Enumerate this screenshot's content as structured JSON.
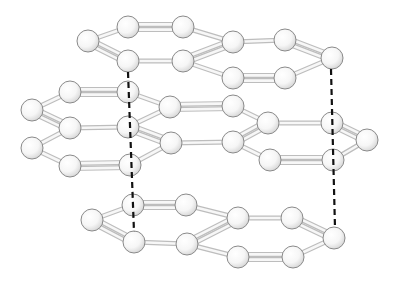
{
  "diagram": {
    "title": "",
    "type": "layered molecular ball-and-stick",
    "colors": {
      "atom_fill": "#ffffff",
      "atom_shade": "#d6d6d6",
      "atom_stroke": "#8a8a8a",
      "bond": "#bdbdbd",
      "interlayer_dash": "#111111"
    },
    "atom_radius": 11,
    "atoms": [
      {
        "id": "t1",
        "x": 88,
        "y": 41
      },
      {
        "id": "t2",
        "x": 128,
        "y": 27
      },
      {
        "id": "t3",
        "x": 183,
        "y": 27
      },
      {
        "id": "t4",
        "x": 233,
        "y": 42
      },
      {
        "id": "t5",
        "x": 183,
        "y": 61
      },
      {
        "id": "t6",
        "x": 128,
        "y": 61
      },
      {
        "id": "t7",
        "x": 285,
        "y": 40
      },
      {
        "id": "t8",
        "x": 332,
        "y": 58
      },
      {
        "id": "t9",
        "x": 285,
        "y": 78
      },
      {
        "id": "t10",
        "x": 233,
        "y": 78
      },
      {
        "id": "m1",
        "x": 70,
        "y": 92
      },
      {
        "id": "m2",
        "x": 128,
        "y": 92
      },
      {
        "id": "m3",
        "x": 32,
        "y": 110
      },
      {
        "id": "m4",
        "x": 70,
        "y": 128
      },
      {
        "id": "m5",
        "x": 128,
        "y": 127
      },
      {
        "id": "m6",
        "x": 32,
        "y": 148
      },
      {
        "id": "m7",
        "x": 70,
        "y": 166
      },
      {
        "id": "m8",
        "x": 130,
        "y": 165
      },
      {
        "id": "m9",
        "x": 170,
        "y": 107
      },
      {
        "id": "m10",
        "x": 171,
        "y": 143
      },
      {
        "id": "m11",
        "x": 233,
        "y": 106
      },
      {
        "id": "m12",
        "x": 268,
        "y": 123
      },
      {
        "id": "m13",
        "x": 233,
        "y": 142
      },
      {
        "id": "m14",
        "x": 270,
        "y": 160
      },
      {
        "id": "m15",
        "x": 332,
        "y": 123
      },
      {
        "id": "m16",
        "x": 367,
        "y": 140
      },
      {
        "id": "m17",
        "x": 333,
        "y": 160
      },
      {
        "id": "b1",
        "x": 92,
        "y": 220
      },
      {
        "id": "b2",
        "x": 133,
        "y": 205
      },
      {
        "id": "b3",
        "x": 186,
        "y": 205
      },
      {
        "id": "b4",
        "x": 238,
        "y": 218
      },
      {
        "id": "b5",
        "x": 187,
        "y": 244
      },
      {
        "id": "b6",
        "x": 134,
        "y": 242
      },
      {
        "id": "b7",
        "x": 292,
        "y": 218
      },
      {
        "id": "b8",
        "x": 334,
        "y": 238
      },
      {
        "id": "b9",
        "x": 293,
        "y": 257
      },
      {
        "id": "b10",
        "x": 238,
        "y": 257
      }
    ],
    "bonds": [
      {
        "a": "t1",
        "b": "t2",
        "order": 1
      },
      {
        "a": "t2",
        "b": "t3",
        "order": 2
      },
      {
        "a": "t3",
        "b": "t4",
        "order": 1
      },
      {
        "a": "t4",
        "b": "t5",
        "order": 2
      },
      {
        "a": "t5",
        "b": "t6",
        "order": 1
      },
      {
        "a": "t6",
        "b": "t1",
        "order": 2
      },
      {
        "a": "t4",
        "b": "t7",
        "order": 1
      },
      {
        "a": "t7",
        "b": "t8",
        "order": 2
      },
      {
        "a": "t8",
        "b": "t9",
        "order": 1
      },
      {
        "a": "t9",
        "b": "t10",
        "order": 2
      },
      {
        "a": "t10",
        "b": "t5",
        "order": 1
      },
      {
        "a": "m3",
        "b": "m1",
        "order": 1
      },
      {
        "a": "m1",
        "b": "m2",
        "order": 2
      },
      {
        "a": "m3",
        "b": "m4",
        "order": 2
      },
      {
        "a": "m4",
        "b": "m5",
        "order": 1
      },
      {
        "a": "m4",
        "b": "m6",
        "order": 1
      },
      {
        "a": "m6",
        "b": "m7",
        "order": 1
      },
      {
        "a": "m7",
        "b": "m8",
        "order": 2
      },
      {
        "a": "m2",
        "b": "m9",
        "order": 1
      },
      {
        "a": "m5",
        "b": "m9",
        "order": 1
      },
      {
        "a": "m5",
        "b": "m10",
        "order": 2
      },
      {
        "a": "m8",
        "b": "m10",
        "order": 1
      },
      {
        "a": "m9",
        "b": "m11",
        "order": 2
      },
      {
        "a": "m10",
        "b": "m13",
        "order": 1
      },
      {
        "a": "m11",
        "b": "m12",
        "order": 1
      },
      {
        "a": "m12",
        "b": "m13",
        "order": 2
      },
      {
        "a": "m13",
        "b": "m14",
        "order": 1
      },
      {
        "a": "m12",
        "b": "m15",
        "order": 1
      },
      {
        "a": "m15",
        "b": "m16",
        "order": 2
      },
      {
        "a": "m16",
        "b": "m17",
        "order": 1
      },
      {
        "a": "m17",
        "b": "m14",
        "order": 2
      },
      {
        "a": "b1",
        "b": "b2",
        "order": 1
      },
      {
        "a": "b2",
        "b": "b3",
        "order": 2
      },
      {
        "a": "b3",
        "b": "b4",
        "order": 1
      },
      {
        "a": "b4",
        "b": "b5",
        "order": 2
      },
      {
        "a": "b5",
        "b": "b6",
        "order": 1
      },
      {
        "a": "b6",
        "b": "b1",
        "order": 2
      },
      {
        "a": "b4",
        "b": "b7",
        "order": 1
      },
      {
        "a": "b7",
        "b": "b8",
        "order": 2
      },
      {
        "a": "b8",
        "b": "b9",
        "order": 1
      },
      {
        "a": "b9",
        "b": "b10",
        "order": 2
      },
      {
        "a": "b10",
        "b": "b5",
        "order": 1
      }
    ],
    "interlayer_lines": [
      {
        "x1": 128,
        "y1": 72,
        "x2": 134,
        "y2": 232
      },
      {
        "x1": 331,
        "y1": 69,
        "x2": 335,
        "y2": 228
      }
    ]
  }
}
